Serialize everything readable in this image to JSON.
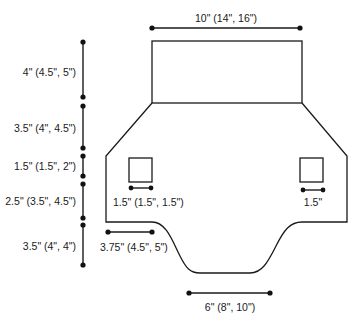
{
  "diagram": {
    "type": "garment-schematic",
    "colors": {
      "line": "#1a1a1a",
      "background": "#ffffff"
    },
    "top_width": {
      "label": "10\" (14\", 16\")"
    },
    "vertical_dimensions": [
      {
        "label": "4\" (4.5\", 5\")"
      },
      {
        "label": "3.5\" (4\", 4.5\")"
      },
      {
        "label": "1.5\" (1.5\", 2\")"
      },
      {
        "label": "2.5\" (3.5\", 4.5\")"
      },
      {
        "label": "3.5\" (4\", 4\")"
      }
    ],
    "left_square": {
      "label": "1.5\" (1.5\", 1.5\")"
    },
    "right_square": {
      "label": "1.5\""
    },
    "lower_left_width": {
      "label": "3.75\" (4.5\", 5\")"
    },
    "bottom_width": {
      "label": "6\" (8\", 10\")"
    }
  }
}
